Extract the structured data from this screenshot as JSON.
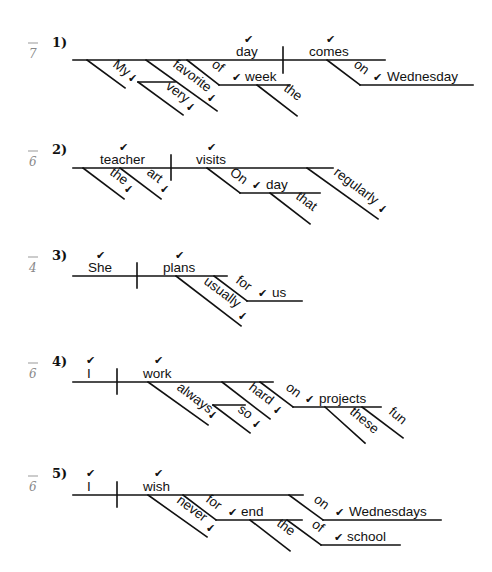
{
  "worksheet": {
    "items": [
      {
        "number": "1)",
        "score": "7",
        "subject": "day",
        "verb": "comes",
        "modifiers": [
          "My",
          "favorite",
          "very",
          "of",
          "week",
          "the",
          "on",
          "Wednesday"
        ]
      },
      {
        "number": "2)",
        "score": "6",
        "subject": "teacher",
        "verb": "visits",
        "modifiers": [
          "the",
          "art",
          "On",
          "day",
          "that",
          "regularly"
        ]
      },
      {
        "number": "3)",
        "score": "4",
        "subject": "She",
        "verb": "plans",
        "modifiers": [
          "usually",
          "for",
          "us"
        ]
      },
      {
        "number": "4)",
        "score": "6",
        "subject": "I",
        "verb": "work",
        "modifiers": [
          "always",
          "hard",
          "so",
          "on",
          "projects",
          "these",
          "fun"
        ]
      },
      {
        "number": "5)",
        "score": "6",
        "subject": "I",
        "verb": "wish",
        "modifiers": [
          "never",
          "for",
          "end",
          "the",
          "on",
          "Wednesdays",
          "of",
          "school"
        ]
      }
    ],
    "check_mark": "✔",
    "small_check": "✓"
  }
}
